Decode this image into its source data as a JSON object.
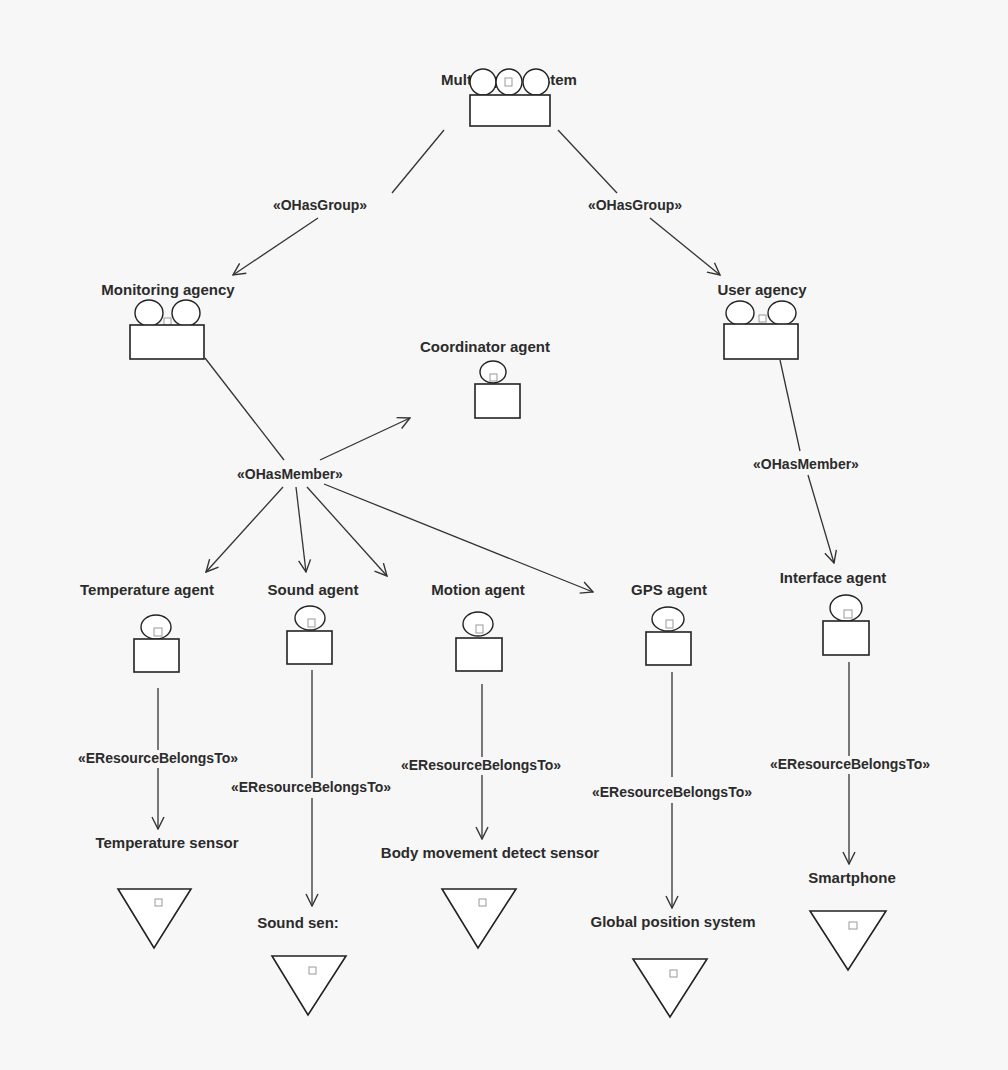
{
  "diagram": {
    "type": "multi-agent organization diagram",
    "nodes": {
      "mas": {
        "label": "Multi-agent system",
        "kind": "organization"
      },
      "monitoring_agency": {
        "label": "Monitoring agency",
        "kind": "group"
      },
      "user_agency": {
        "label": "User agency",
        "kind": "group"
      },
      "coordinator_agent": {
        "label": "Coordinator agent",
        "kind": "agent"
      },
      "temperature_agent": {
        "label": "Temperature agent",
        "kind": "agent"
      },
      "sound_agent": {
        "label": "Sound agent",
        "kind": "agent"
      },
      "motion_agent": {
        "label": "Motion agent",
        "kind": "agent"
      },
      "gps_agent": {
        "label": "GPS agent",
        "kind": "agent"
      },
      "interface_agent": {
        "label": "Interface agent",
        "kind": "agent"
      },
      "temperature_sensor": {
        "label": "Temperature sensor",
        "kind": "resource"
      },
      "sound_sensor": {
        "label": "Sound sen:",
        "kind": "resource"
      },
      "body_movement_sensor": {
        "label": "Body movement detect sensor",
        "kind": "resource"
      },
      "gps_system": {
        "label": "Global position system",
        "kind": "resource"
      },
      "smartphone": {
        "label": "Smartphone",
        "kind": "resource"
      }
    },
    "stereotypes": {
      "has_group": "«OHasGroup»",
      "has_member": "«OHasMember»",
      "resource_belongs_to": "«EResourceBelongsTo»"
    },
    "edges": [
      {
        "from": "mas",
        "to": "monitoring_agency",
        "stereotype": "«OHasGroup»"
      },
      {
        "from": "mas",
        "to": "user_agency",
        "stereotype": "«OHasGroup»"
      },
      {
        "from": "monitoring_agency",
        "to": "coordinator_agent",
        "stereotype": "«OHasMember»"
      },
      {
        "from": "monitoring_agency",
        "to": "temperature_agent",
        "stereotype": "«OHasMember»"
      },
      {
        "from": "monitoring_agency",
        "to": "sound_agent",
        "stereotype": "«OHasMember»"
      },
      {
        "from": "monitoring_agency",
        "to": "motion_agent",
        "stereotype": "«OHasMember»"
      },
      {
        "from": "monitoring_agency",
        "to": "gps_agent",
        "stereotype": "«OHasMember»"
      },
      {
        "from": "user_agency",
        "to": "interface_agent",
        "stereotype": "«OHasMember»"
      },
      {
        "from": "temperature_agent",
        "to": "temperature_sensor",
        "stereotype": "«EResourceBelongsTo»"
      },
      {
        "from": "sound_agent",
        "to": "sound_sensor",
        "stereotype": "«EResourceBelongsTo»"
      },
      {
        "from": "motion_agent",
        "to": "body_movement_sensor",
        "stereotype": "«EResourceBelongsTo»"
      },
      {
        "from": "gps_agent",
        "to": "gps_system",
        "stereotype": "«EResourceBelongsTo»"
      },
      {
        "from": "interface_agent",
        "to": "smartphone",
        "stereotype": "«EResourceBelongsTo»"
      }
    ]
  }
}
